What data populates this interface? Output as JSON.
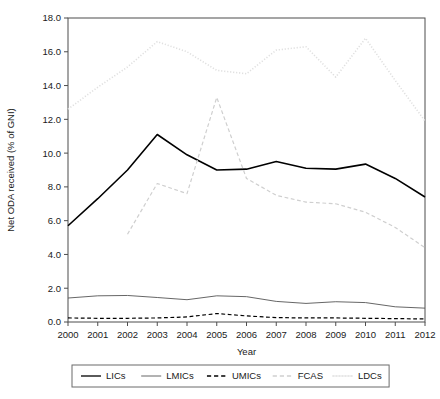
{
  "chart_data": {
    "type": "line",
    "title": "",
    "xlabel": "Year",
    "ylabel": "Net ODA received (% of GNI)",
    "x": [
      2000,
      2001,
      2002,
      2003,
      2004,
      2005,
      2006,
      2007,
      2008,
      2009,
      2010,
      2011,
      2012
    ],
    "xtick_labels": [
      "2000",
      "2001",
      "2002",
      "2003",
      "2004",
      "2005",
      "2006",
      "2007",
      "2008",
      "2009",
      "2010",
      "2011",
      "2012"
    ],
    "ytick_labels": [
      "0.0",
      "2.0",
      "4.0",
      "6.0",
      "8.0",
      "10.0",
      "12.0",
      "14.0",
      "16.0",
      "18.0"
    ],
    "ytick_values": [
      0.0,
      2.0,
      4.0,
      6.0,
      8.0,
      10.0,
      12.0,
      14.0,
      16.0,
      18.0
    ],
    "xlim": [
      2000,
      2012
    ],
    "ylim": [
      0.0,
      18.0
    ],
    "grid": false,
    "legend_position": "below",
    "series": [
      {
        "name": "LICs",
        "color": "#000000",
        "style": "solid",
        "width": 1.6,
        "values": [
          5.7,
          7.3,
          9.0,
          11.1,
          9.9,
          9.0,
          9.05,
          9.5,
          9.1,
          9.05,
          9.35,
          8.5,
          7.4
        ]
      },
      {
        "name": "LMICs",
        "color": "#555555",
        "style": "solid",
        "width": 0.9,
        "values": [
          1.42,
          1.55,
          1.57,
          1.45,
          1.32,
          1.55,
          1.5,
          1.22,
          1.1,
          1.2,
          1.15,
          0.9,
          0.82
        ]
      },
      {
        "name": "UMICs",
        "color": "#000000",
        "style": "dashed",
        "width": 1.2,
        "values": [
          0.24,
          0.22,
          0.22,
          0.24,
          0.3,
          0.5,
          0.36,
          0.26,
          0.24,
          0.24,
          0.22,
          0.2,
          0.18
        ]
      },
      {
        "name": "FCAS",
        "color": "#cfcfcf",
        "style": "dashed",
        "width": 1.2,
        "values": [
          null,
          null,
          5.2,
          8.2,
          7.6,
          13.3,
          8.5,
          7.5,
          7.1,
          7.0,
          6.5,
          5.6,
          4.4
        ]
      },
      {
        "name": "LDCs",
        "color": "#e0e0e0",
        "style": "dotted",
        "width": 1.6,
        "values": [
          12.6,
          13.9,
          15.1,
          16.6,
          16.0,
          14.9,
          14.7,
          16.1,
          16.3,
          14.5,
          16.8,
          14.3,
          11.9
        ]
      }
    ],
    "legend_entries": [
      {
        "label": "LICs",
        "color": "#000000",
        "style": "solid"
      },
      {
        "label": "LMICs",
        "color": "#555555",
        "style": "solid"
      },
      {
        "label": "UMICs",
        "color": "#000000",
        "style": "dashed"
      },
      {
        "label": "FCAS",
        "color": "#cfcfcf",
        "style": "dashed"
      },
      {
        "label": "LDCs",
        "color": "#e0e0e0",
        "style": "dotted"
      }
    ]
  }
}
